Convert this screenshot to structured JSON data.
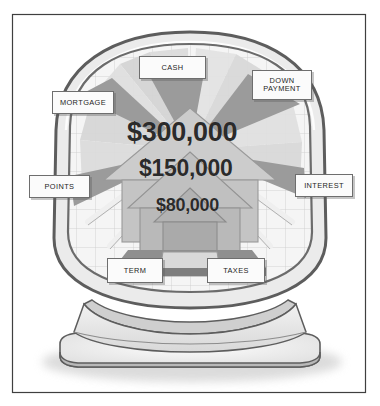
{
  "illustration": {
    "title": "Mortgage cost breakdown on a computer monitor",
    "subject": "computer-monitor-house-diagram",
    "frame_color": "#3f3f3f",
    "background_color": "#ffffff"
  },
  "monitor": {
    "bezel_color": "#e9e9e9",
    "outline_color": "#5d5d5d",
    "screen_color": "#f4f4f4",
    "grid_color": "#c9c9c9",
    "stand_color": "#e4e4e4",
    "base_color": "#ededed"
  },
  "house": {
    "body_color": "#b6b6b6",
    "roof_color": "#c9c9c9",
    "shadow_color": "#8f8f8f",
    "beam_color": "#e2e2e2",
    "wedge_color": "#9a9a9a"
  },
  "amounts": [
    {
      "id": "amount-top",
      "value": "$300,000"
    },
    {
      "id": "amount-middle",
      "value": "$150,000"
    },
    {
      "id": "amount-bottom",
      "value": "$80,000"
    }
  ],
  "labels": [
    {
      "id": "label-cash",
      "name": "cash",
      "lines": [
        "CASH"
      ]
    },
    {
      "id": "label-down-payment",
      "name": "down-payment",
      "lines": [
        "DOWN",
        "PAYMENT"
      ]
    },
    {
      "id": "label-mortgage",
      "name": "mortgage",
      "lines": [
        "MORTGAGE"
      ]
    },
    {
      "id": "label-points",
      "name": "points",
      "lines": [
        "POINTS"
      ]
    },
    {
      "id": "label-interest",
      "name": "interest",
      "lines": [
        "INTEREST"
      ]
    },
    {
      "id": "label-term",
      "name": "term",
      "lines": [
        "TERM"
      ]
    },
    {
      "id": "label-taxes",
      "name": "taxes",
      "lines": [
        "TAXES"
      ]
    }
  ]
}
